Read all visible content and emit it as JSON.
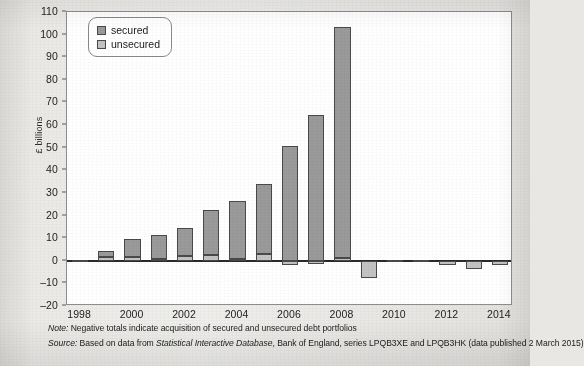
{
  "chart_data": {
    "type": "bar",
    "stacked": true,
    "title": "",
    "xlabel": "",
    "ylabel": "£ billions",
    "ylim": [
      -20,
      110
    ],
    "yticks": [
      110,
      100,
      90,
      80,
      70,
      60,
      50,
      40,
      30,
      20,
      10,
      0,
      -10,
      -20
    ],
    "ytick_labels": [
      "110",
      "100",
      "90",
      "80",
      "70",
      "60",
      "50",
      "40",
      "30",
      "20",
      "10",
      "0",
      "–10",
      "–20"
    ],
    "grid": false,
    "legend_position": "upper-left",
    "categories": [
      1998,
      1999,
      2000,
      2001,
      2002,
      2003,
      2004,
      2005,
      2006,
      2007,
      2008,
      2009,
      2010,
      2011,
      2012,
      2013,
      2014
    ],
    "xtick_labels": [
      "1998",
      "2000",
      "2002",
      "2004",
      "2006",
      "2008",
      "2010",
      "2012",
      "2014"
    ],
    "xticks": [
      1998,
      2000,
      2002,
      2004,
      2006,
      2008,
      2010,
      2012,
      2014
    ],
    "series": [
      {
        "name": "unsecured",
        "color": "#c3c3c3",
        "values": [
          0.5,
          1.8,
          1.5,
          0.7,
          2.0,
          2.4,
          0.7,
          3.0,
          -1.8,
          -1.5,
          1.2,
          -7.5,
          0.2,
          0.5,
          -2.0,
          -3.5,
          -2.0
        ]
      },
      {
        "name": "secured",
        "color": "#9a9a9a",
        "values": [
          0.0,
          2.7,
          8.0,
          10.8,
          12.5,
          20.1,
          25.8,
          31.0,
          50.6,
          64.5,
          102.3,
          0.0,
          0.0,
          0.0,
          0.0,
          0.0,
          0.0
        ]
      }
    ],
    "totals": [
      0.5,
      4.5,
      9.5,
      11.5,
      14.5,
      22.5,
      26.5,
      34.0,
      48.8,
      63.0,
      103.5,
      -7.5,
      0.2,
      0.5,
      -2.0,
      -3.5,
      -2.0
    ]
  },
  "legend": {
    "items": [
      {
        "label": "secured",
        "swatch": "secured"
      },
      {
        "label": "unsecured",
        "swatch": "unsecured"
      }
    ]
  },
  "axis": {
    "y_title": "£ billions"
  },
  "notes": {
    "note_lead": "Note:",
    "note_text": " Negative totals indicate acquisition of secured and unsecured debt portfolios",
    "source_lead": "Source:",
    "source_text_a": " Based on data from ",
    "source_italic": "Statistical Interactive Database",
    "source_text_b": ", Bank of England, series LPQB3XE and LPQB3HK (data published 2 March 2015)"
  }
}
